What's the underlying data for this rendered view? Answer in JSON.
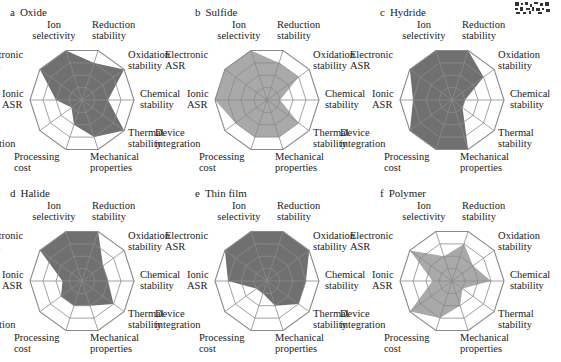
{
  "figure": {
    "axes": [
      "Ion selectivity",
      "Reduction stability",
      "Oxidation stability",
      "Chemical stability",
      "Thermal stability",
      "Mechanical properties",
      "Processing cost",
      "Device integration",
      "Ionic ASR",
      "Electronic ASR"
    ],
    "axis_labels": [
      {
        "line1": "Ion",
        "line2": "selectivity"
      },
      {
        "line1": "Reduction",
        "line2": "stability"
      },
      {
        "line1": "Oxidation",
        "line2": "stability"
      },
      {
        "line1": "Chemical",
        "line2": "stability"
      },
      {
        "line1": "Thermal",
        "line2": "stability"
      },
      {
        "line1": "Mechanical",
        "line2": "properties"
      },
      {
        "line1": "Processing",
        "line2": "cost"
      },
      {
        "line1": "Device",
        "line2": "integration"
      },
      {
        "line1": "Ionic",
        "line2": "ASR"
      },
      {
        "line1": "Electronic",
        "line2": "ASR"
      }
    ],
    "panels": [
      {
        "letter": "a",
        "title": "Oxide"
      },
      {
        "letter": "b",
        "title": "Sulfide"
      },
      {
        "letter": "c",
        "title": "Hydride"
      },
      {
        "letter": "d",
        "title": "Halide"
      },
      {
        "letter": "e",
        "title": "Thin film"
      },
      {
        "letter": "f",
        "title": "Polymer"
      }
    ],
    "colors": {
      "grid": "#8a8a8a",
      "dark_fill": "#707070",
      "light_fill": "#a9a9a9"
    }
  },
  "chart_data": [
    {
      "type": "radar",
      "title": "a Oxide",
      "categories": [
        "Ion selectivity",
        "Reduction stability",
        "Oxidation stability",
        "Chemical stability",
        "Thermal stability",
        "Mechanical properties",
        "Processing cost",
        "Device integration",
        "Ionic ASR",
        "Electronic ASR"
      ],
      "values": [
        4,
        3,
        4,
        2,
        4,
        3,
        2,
        1,
        2,
        4
      ],
      "range": [
        0,
        4
      ],
      "rings": 4,
      "fill": "dark"
    },
    {
      "type": "radar",
      "title": "b Sulfide",
      "categories": [
        "Ion selectivity",
        "Reduction stability",
        "Oxidation stability",
        "Chemical stability",
        "Thermal stability",
        "Mechanical properties",
        "Processing cost",
        "Device integration",
        "Ionic ASR",
        "Electronic ASR"
      ],
      "values": [
        4,
        3,
        3,
        1,
        3,
        3,
        3,
        3,
        4,
        4
      ],
      "range": [
        0,
        4
      ],
      "rings": 4,
      "fill": "light"
    },
    {
      "type": "radar",
      "title": "c Hydride",
      "categories": [
        "Ion selectivity",
        "Reduction stability",
        "Oxidation stability",
        "Chemical stability",
        "Thermal stability",
        "Mechanical properties",
        "Processing cost",
        "Device integration",
        "Ionic ASR",
        "Electronic ASR"
      ],
      "values": [
        4,
        4,
        3,
        1,
        1,
        4,
        4,
        4,
        3,
        4
      ],
      "range": [
        0,
        4
      ],
      "rings": 4,
      "fill": "dark"
    },
    {
      "type": "radar",
      "title": "d Halide",
      "categories": [
        "Ion selectivity",
        "Reduction stability",
        "Oxidation stability",
        "Chemical stability",
        "Thermal stability",
        "Mechanical properties",
        "Processing cost",
        "Device integration",
        "Ionic ASR",
        "Electronic ASR"
      ],
      "values": [
        4,
        4,
        2,
        2,
        3,
        2,
        2,
        2,
        1.5,
        4
      ],
      "range": [
        0,
        4
      ],
      "rings": 4,
      "fill": "dark"
    },
    {
      "type": "radar",
      "title": "e Thin film",
      "categories": [
        "Ion selectivity",
        "Reduction stability",
        "Oxidation stability",
        "Chemical stability",
        "Thermal stability",
        "Mechanical properties",
        "Processing cost",
        "Device integration",
        "Ionic ASR",
        "Electronic ASR"
      ],
      "values": [
        4,
        4,
        4,
        3,
        3,
        2,
        1,
        1,
        3,
        4
      ],
      "range": [
        0,
        4
      ],
      "rings": 4,
      "fill": "dark"
    },
    {
      "type": "radar",
      "title": "f Polymer",
      "categories": [
        "Ion selectivity",
        "Reduction stability",
        "Oxidation stability",
        "Chemical stability",
        "Thermal stability",
        "Mechanical properties",
        "Processing cost",
        "Device integration",
        "Ionic ASR",
        "Electronic ASR"
      ],
      "values": [
        2,
        3,
        2,
        3,
        1,
        2,
        3,
        4,
        1.5,
        4
      ],
      "range": [
        0,
        4
      ],
      "rings": 4,
      "fill": "light"
    }
  ]
}
